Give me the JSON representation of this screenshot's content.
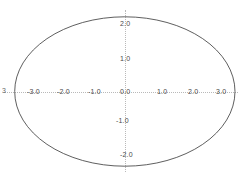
{
  "chart_data": {
    "type": "line",
    "title": "",
    "subtitle": "",
    "xlabel": "",
    "ylabel": "",
    "xlim": [
      -3.4,
      3.3
    ],
    "ylim": [
      -2.45,
      2.45
    ],
    "grid": false,
    "legend": null,
    "axes": {
      "x_axis_value": 0.0,
      "y_axis_value": 0.0,
      "style": "dotted",
      "color": "#b9b9b9"
    },
    "xticks": [
      -3.0,
      -2.0,
      -1.0,
      1.0,
      2.0,
      3.0
    ],
    "xtick_labels": [
      "-3.0",
      "-2.0",
      "-1.0",
      "1.0",
      "2.0",
      "3.0"
    ],
    "yticks": [
      2.0,
      1.0,
      0.0,
      -1.0,
      -2.0
    ],
    "ytick_labels": [
      "2.0",
      "1.0",
      "0.0",
      "-1.0",
      "-2.0"
    ],
    "origin_label": "0.0",
    "clipped_left_label": "3",
    "series": [
      {
        "name": "ellipse",
        "type": "closed-curve",
        "shape": "ellipse",
        "color": "#4d4d4d",
        "linewidth": 0.9,
        "center": [
          0.0,
          0.0
        ],
        "semi_axis_x": 3.0,
        "semi_axis_y": 2.0,
        "equation": "x^2/9 + y^2/4 = 1",
        "extreme_points": [
          {
            "label": "right vertex",
            "x": 3.0,
            "y": 0.0
          },
          {
            "label": "top vertex",
            "x": 0.0,
            "y": 2.0
          },
          {
            "label": "left vertex",
            "x": -3.0,
            "y": 0.0
          },
          {
            "label": "bottom vertex",
            "x": 0.0,
            "y": -2.0
          }
        ]
      }
    ]
  },
  "labels": {
    "x_neg3": "-3.0",
    "x_neg2": "-2.0",
    "x_neg1": "-1.0",
    "x_pos1": "1.0",
    "x_pos2": "2.0",
    "x_pos3": "3.0",
    "y_pos2": "2.0",
    "y_pos1": "1.0",
    "y_zero": "0.0",
    "y_neg1": "-1.0",
    "y_neg2": "-2.0",
    "edge_clip": "3"
  },
  "colors": {
    "background": "#ffffff",
    "axis": "#b9b9b9",
    "curve": "#4d4d4d",
    "tick_text": "#4a4a4a"
  }
}
